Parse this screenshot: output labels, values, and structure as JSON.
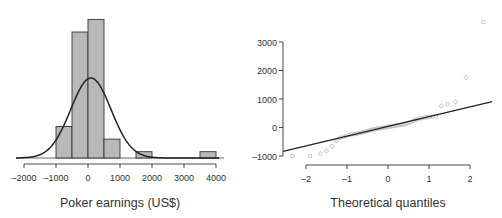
{
  "chart_data": [
    {
      "type": "bar",
      "subtype": "histogram",
      "title": "",
      "xlabel": "Poker earnings (US$)",
      "ylabel": "",
      "bins": [
        {
          "from": -1000,
          "to": -500,
          "count": 5
        },
        {
          "from": -500,
          "to": 0,
          "count": 20
        },
        {
          "from": 0,
          "to": 500,
          "count": 22
        },
        {
          "from": 500,
          "to": 1000,
          "count": 3
        },
        {
          "from": 1000,
          "to": 1500,
          "count": 0
        },
        {
          "from": 1500,
          "to": 2000,
          "count": 1
        },
        {
          "from": 2000,
          "to": 2500,
          "count": 0
        },
        {
          "from": 2500,
          "to": 3000,
          "count": 0
        },
        {
          "from": 3000,
          "to": 3500,
          "count": 0
        },
        {
          "from": 3500,
          "to": 4000,
          "count": 1
        }
      ],
      "categories": [
        "-1000–-500",
        "-500–0",
        "0–500",
        "500–1000",
        "1000–1500",
        "1500–2000",
        "2000–2500",
        "2500–3000",
        "3000–3500",
        "3500–4000"
      ],
      "values": [
        5,
        20,
        22,
        3,
        0,
        1,
        0,
        0,
        0,
        1
      ],
      "overlay": {
        "type": "normal-density-curve",
        "mean": 90,
        "sd": 630
      },
      "xticks": [
        "-2000",
        "-1000",
        "0",
        "1000",
        "2000",
        "3000",
        "4000"
      ],
      "xlim": [
        -2300,
        4200
      ],
      "grid": false,
      "bar_color": "#b8b8b8"
    },
    {
      "type": "scatter",
      "subtype": "normal-qq-plot",
      "title": "",
      "xlabel": "Theoretical quantiles",
      "ylabel": "",
      "xticks": [
        "-2",
        "-1",
        "0",
        "1",
        "2"
      ],
      "yticks": [
        "-1000",
        "0",
        "1000",
        "2000",
        "3000"
      ],
      "xlim": [
        -2.6,
        2.6
      ],
      "ylim": [
        -1100,
        3900
      ],
      "grid": false,
      "reference_line": {
        "x1": -2.56,
        "y1": -840,
        "x2": 2.54,
        "y2": 910
      },
      "points": [
        [
          -2.33,
          -1000
        ],
        [
          -1.9,
          -1000
        ],
        [
          -1.65,
          -920
        ],
        [
          -1.5,
          -820
        ],
        [
          -1.37,
          -660
        ],
        [
          -1.26,
          -470
        ],
        [
          -1.17,
          -360
        ],
        [
          -1.09,
          -320
        ],
        [
          -1.02,
          -300
        ],
        [
          -0.95,
          -270
        ],
        [
          -0.89,
          -240
        ],
        [
          -0.83,
          -230
        ],
        [
          -0.77,
          -220
        ],
        [
          -0.72,
          -200
        ],
        [
          -0.67,
          -190
        ],
        [
          -0.62,
          -170
        ],
        [
          -0.57,
          -150
        ],
        [
          -0.52,
          -130
        ],
        [
          -0.47,
          -110
        ],
        [
          -0.43,
          -100
        ],
        [
          -0.38,
          -80
        ],
        [
          -0.34,
          -60
        ],
        [
          -0.29,
          -50
        ],
        [
          -0.25,
          -40
        ],
        [
          -0.2,
          -30
        ],
        [
          -0.16,
          -20
        ],
        [
          -0.12,
          -10
        ],
        [
          -0.08,
          0
        ],
        [
          -0.04,
          10
        ],
        [
          0.0,
          20
        ],
        [
          0.04,
          30
        ],
        [
          0.08,
          40
        ],
        [
          0.12,
          50
        ],
        [
          0.16,
          60
        ],
        [
          0.2,
          70
        ],
        [
          0.25,
          80
        ],
        [
          0.29,
          90
        ],
        [
          0.34,
          100
        ],
        [
          0.38,
          110
        ],
        [
          0.43,
          120
        ],
        [
          0.47,
          140
        ],
        [
          0.52,
          160
        ],
        [
          0.57,
          190
        ],
        [
          0.62,
          230
        ],
        [
          0.67,
          270
        ],
        [
          0.72,
          290
        ],
        [
          0.77,
          310
        ],
        [
          0.83,
          330
        ],
        [
          0.89,
          350
        ],
        [
          0.95,
          360
        ],
        [
          1.02,
          370
        ],
        [
          1.09,
          380
        ],
        [
          1.17,
          390
        ],
        [
          1.3,
          760
        ],
        [
          1.45,
          820
        ],
        [
          1.65,
          900
        ],
        [
          1.9,
          1750
        ],
        [
          2.33,
          3700
        ]
      ],
      "point_color": "#bdbdbd"
    }
  ]
}
